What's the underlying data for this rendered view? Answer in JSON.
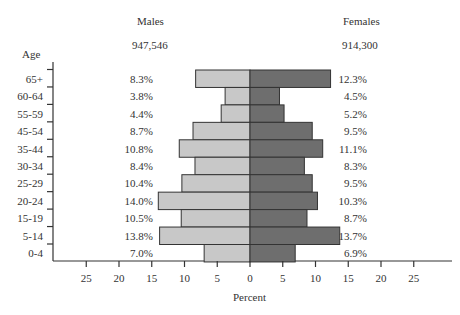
{
  "chart_data": {
    "type": "bar",
    "orientation": "horizontal",
    "subtype": "population-pyramid",
    "title": "",
    "xlabel": "Percent",
    "ylabel": "Age",
    "categories": [
      "65+",
      "60-64",
      "55-59",
      "45-54",
      "35-44",
      "30-34",
      "25-29",
      "20-24",
      "15-19",
      "5-14",
      "0-4"
    ],
    "series": [
      {
        "name": "Males",
        "total": "947,546",
        "color": "#c8c8c8",
        "values": [
          8.3,
          3.8,
          4.4,
          8.7,
          10.8,
          8.4,
          10.4,
          14.0,
          10.5,
          13.8,
          7.0
        ],
        "labels": [
          "8.3%",
          "3.8%",
          "4.4%",
          "8.7%",
          "10.8%",
          "8.4%",
          "10.4%",
          "14.0%",
          "10.5%",
          "13.8%",
          "7.0%"
        ]
      },
      {
        "name": "Females",
        "total": "914,300",
        "color": "#6e6e6e",
        "values": [
          12.3,
          4.5,
          5.2,
          9.5,
          11.1,
          8.3,
          9.5,
          10.3,
          8.7,
          13.7,
          6.9
        ],
        "labels": [
          "12.3%",
          "4.5%",
          "5.2%",
          "9.5%",
          "11.1%",
          "8.3%",
          "9.5%",
          "10.3%",
          "8.7%",
          "13.7%",
          "6.9%"
        ]
      }
    ],
    "xticks": [
      "25",
      "20",
      "15",
      "10",
      "5",
      "0",
      "5",
      "10",
      "15",
      "20",
      "25"
    ],
    "xtick_values": [
      -25,
      -20,
      -15,
      -10,
      -5,
      0,
      5,
      10,
      15,
      20,
      25
    ],
    "xlim": [
      -30,
      30
    ],
    "grid": false,
    "legend": "headers above each side"
  },
  "headers": {
    "males_label": "Males",
    "males_total": "947,546",
    "females_label": "Females",
    "females_total": "914,300",
    "age_label": "Age",
    "x_axis_label": "Percent"
  },
  "style": {
    "male_color": "#c8c8c8",
    "female_color": "#6e6e6e",
    "border_color": "#333333",
    "text_color": "#333333"
  }
}
